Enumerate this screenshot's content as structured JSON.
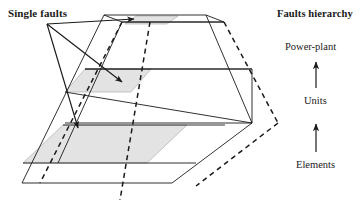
{
  "figure": {
    "type": "isometric-layered-frustum-diagram",
    "background_color": "#ffffff",
    "line_color": "#1a1a1a",
    "shade_color": "#e2e2e2",
    "shade_stroke": "#9a9a9a"
  },
  "annotations": {
    "single_faults_label": "Single faults",
    "arrow_count": 3
  },
  "hierarchy": {
    "title": "Faults hierarchy",
    "levels": [
      {
        "label": "Power-plant"
      },
      {
        "label": "Units"
      },
      {
        "label": "Elements"
      }
    ],
    "arrow_up_icon": "arrow-up-icon"
  },
  "geometry": {
    "solid_outline": "104,15 206,15 252,123 278,123 252,123 172,183 22,183",
    "top_face": "104,15 206,15 224,22 122,22",
    "layers": [
      {
        "name": "power-plant-layer",
        "shaded": true
      },
      {
        "name": "units-layer",
        "shaded": true
      },
      {
        "name": "elements-layer",
        "shaded": true
      }
    ]
  }
}
